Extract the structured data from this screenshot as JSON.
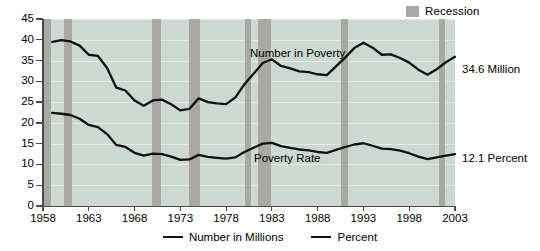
{
  "legend_top": {
    "recession_label": "Recession",
    "recession_color": "#a8a9a4"
  },
  "annotations": {
    "number_in_poverty": "Number in Poverty",
    "poverty_rate": "Poverty Rate"
  },
  "end_labels": {
    "number": "34.6 Million",
    "rate": "12.1 Percent"
  },
  "legend_bottom": {
    "items": [
      {
        "label": "Number in Millions",
        "color": "#111111"
      },
      {
        "label": "Percent",
        "color": "#111111"
      }
    ]
  },
  "axes": {
    "y_ticks": [
      "0",
      "5",
      "10",
      "15",
      "20",
      "25",
      "30",
      "35",
      "40",
      "45"
    ],
    "x_ticks": [
      "1958",
      "1963",
      "1968",
      "1973",
      "1978",
      "1983",
      "1988",
      "1993",
      "1998",
      "2003"
    ]
  },
  "chart_data": {
    "type": "line",
    "title": "",
    "subtitle": "",
    "xlabel": "",
    "ylabel": "",
    "xlim": [
      1958,
      2003
    ],
    "ylim": [
      0,
      45
    ],
    "grid": true,
    "legend_position": "bottom-center",
    "plot_background": "#cdd8d2",
    "gridline_color": "#e3ebe6",
    "x": [
      1959,
      1960,
      1961,
      1962,
      1963,
      1964,
      1965,
      1966,
      1967,
      1968,
      1969,
      1970,
      1971,
      1972,
      1973,
      1974,
      1975,
      1976,
      1977,
      1978,
      1979,
      1980,
      1981,
      1982,
      1983,
      1984,
      1985,
      1986,
      1987,
      1988,
      1989,
      1990,
      1991,
      1992,
      1993,
      1994,
      1995,
      1996,
      1997,
      1998,
      1999,
      2000,
      2001,
      2002,
      2003
    ],
    "series": [
      {
        "name": "Number in Millions",
        "annotation": "Number in Poverty",
        "color": "#111111",
        "units": "millions",
        "end_value": 34.6,
        "values": [
          39.5,
          39.9,
          39.6,
          38.6,
          36.4,
          36.1,
          33.2,
          28.5,
          27.8,
          25.4,
          24.1,
          25.4,
          25.6,
          24.5,
          23.0,
          23.4,
          25.9,
          25.0,
          24.7,
          24.5,
          26.1,
          29.3,
          31.8,
          34.4,
          35.3,
          33.7,
          33.1,
          32.4,
          32.2,
          31.7,
          31.5,
          33.6,
          35.7,
          38.0,
          39.3,
          38.1,
          36.4,
          36.5,
          35.6,
          34.5,
          32.8,
          31.6,
          32.9,
          34.6,
          35.9
        ]
      },
      {
        "name": "Percent",
        "annotation": "Poverty Rate",
        "color": "#111111",
        "units": "percent",
        "end_value": 12.1,
        "values": [
          22.4,
          22.2,
          21.9,
          21.0,
          19.5,
          19.0,
          17.3,
          14.7,
          14.2,
          12.8,
          12.1,
          12.6,
          12.5,
          11.9,
          11.1,
          11.2,
          12.3,
          11.8,
          11.6,
          11.4,
          11.7,
          13.0,
          14.0,
          15.0,
          15.2,
          14.4,
          14.0,
          13.6,
          13.4,
          13.0,
          12.8,
          13.5,
          14.2,
          14.8,
          15.1,
          14.5,
          13.8,
          13.7,
          13.3,
          12.7,
          11.9,
          11.3,
          11.7,
          12.1,
          12.5
        ]
      }
    ],
    "recession_bands": [
      {
        "start": 1957.8,
        "end": 1958.9
      },
      {
        "start": 1960.3,
        "end": 1961.2
      },
      {
        "start": 1969.9,
        "end": 1970.9
      },
      {
        "start": 1973.9,
        "end": 1975.2
      },
      {
        "start": 1980.1,
        "end": 1980.7
      },
      {
        "start": 1981.5,
        "end": 1982.9
      },
      {
        "start": 1990.5,
        "end": 1991.3
      },
      {
        "start": 2001.2,
        "end": 2001.9
      }
    ]
  }
}
